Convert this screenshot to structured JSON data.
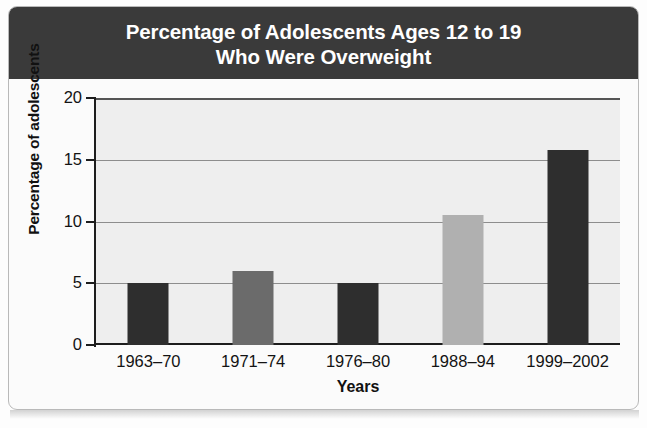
{
  "figure": {
    "title_lines": [
      "Percentage of Adolescents Ages 12 to 19",
      "Who Were Overweight"
    ],
    "title_background": "#3a3a3a",
    "title_color": "#ffffff",
    "plot_background": "#eeeeee"
  },
  "chart_data": {
    "type": "bar",
    "title": "Percentage of Adolescents Ages 12 to 19 Who Were Overweight",
    "categories": [
      "1963–70",
      "1971–74",
      "1976–80",
      "1988–94",
      "1999–2002"
    ],
    "values": [
      5.0,
      6.0,
      5.0,
      10.5,
      15.8
    ],
    "bar_colors": [
      "#2e2e2e",
      "#6b6b6b",
      "#2e2e2e",
      "#b0b0b0",
      "#2e2e2e"
    ],
    "xlabel": "Years",
    "ylabel": "Percentage of adolescents",
    "ylim": [
      0,
      20
    ],
    "yticks": [
      0,
      5,
      10,
      15,
      20
    ],
    "ytick_labels": [
      "0",
      "5",
      "10",
      "15",
      "20"
    ],
    "grid": true,
    "grid_axis": "y",
    "legend": false
  },
  "bleed_text": [
    "the same time period.",
    "shows the results of the study."
  ]
}
